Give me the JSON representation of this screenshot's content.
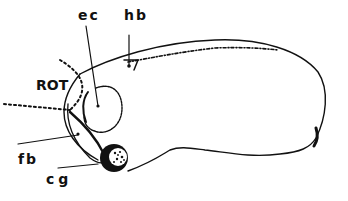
{
  "diagram": {
    "type": "anatomical line drawing (embryo, lateral view)",
    "labels": {
      "ec": "ec",
      "hb": "hb",
      "rot": "ROT",
      "fb": "fb",
      "cg": "cg"
    },
    "colors": {
      "ink": "#111111",
      "background": "#ffffff"
    }
  }
}
